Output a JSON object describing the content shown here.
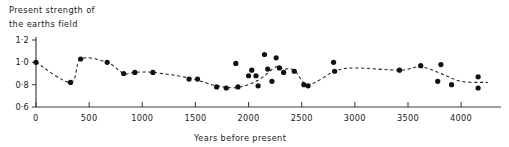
{
  "figure": {
    "title_line1": "Present strength of",
    "title_line2": "the earths field",
    "background_color": "#ffffff",
    "ink_color": "#1a1a1a"
  },
  "chart_data": {
    "type": "scatter",
    "title": "Present strength of the earths field",
    "xlabel": "Years before present",
    "ylabel": "Present strength of the earths field",
    "xlim": [
      0,
      4300
    ],
    "ylim": [
      0.6,
      1.2
    ],
    "grid": false,
    "legend": null,
    "x_ticks": [
      0,
      500,
      1000,
      1500,
      2000,
      2500,
      3000,
      3500,
      4000
    ],
    "x_tick_labels": [
      "0",
      "500",
      "1000",
      "1500",
      "2000",
      "2500",
      "3000",
      "3500",
      "4000"
    ],
    "y_ticks": [
      0.6,
      0.8,
      1.0,
      1.2
    ],
    "y_tick_labels": [
      "0·6",
      "0·8",
      "1·0",
      "1·2"
    ],
    "origin_label": "0",
    "marker": "filled-circle",
    "marker_color": "#121212",
    "trend_line_style": "dashed",
    "trend_line_color": "#222222",
    "points": [
      {
        "x": 0,
        "y": 1.0
      },
      {
        "x": 325,
        "y": 0.82
      },
      {
        "x": 420,
        "y": 1.03
      },
      {
        "x": 670,
        "y": 1.0
      },
      {
        "x": 825,
        "y": 0.9
      },
      {
        "x": 930,
        "y": 0.91
      },
      {
        "x": 1100,
        "y": 0.91
      },
      {
        "x": 1440,
        "y": 0.85
      },
      {
        "x": 1520,
        "y": 0.85
      },
      {
        "x": 1700,
        "y": 0.78
      },
      {
        "x": 1790,
        "y": 0.77
      },
      {
        "x": 1880,
        "y": 0.99
      },
      {
        "x": 1900,
        "y": 0.78
      },
      {
        "x": 2000,
        "y": 0.88
      },
      {
        "x": 2030,
        "y": 0.93
      },
      {
        "x": 2070,
        "y": 0.88
      },
      {
        "x": 2090,
        "y": 0.79
      },
      {
        "x": 2150,
        "y": 1.07
      },
      {
        "x": 2180,
        "y": 0.94
      },
      {
        "x": 2220,
        "y": 0.83
      },
      {
        "x": 2260,
        "y": 1.04
      },
      {
        "x": 2290,
        "y": 0.95
      },
      {
        "x": 2330,
        "y": 0.91
      },
      {
        "x": 2430,
        "y": 0.92
      },
      {
        "x": 2520,
        "y": 0.8
      },
      {
        "x": 2560,
        "y": 0.79
      },
      {
        "x": 2800,
        "y": 1.0
      },
      {
        "x": 2810,
        "y": 0.92
      },
      {
        "x": 3420,
        "y": 0.93
      },
      {
        "x": 3620,
        "y": 0.97
      },
      {
        "x": 3810,
        "y": 0.98
      },
      {
        "x": 3780,
        "y": 0.83
      },
      {
        "x": 3910,
        "y": 0.8
      },
      {
        "x": 4160,
        "y": 0.87
      },
      {
        "x": 4160,
        "y": 0.77
      }
    ],
    "trend_points": [
      {
        "x": 0,
        "y": 1.0
      },
      {
        "x": 325,
        "y": 0.82
      },
      {
        "x": 420,
        "y": 1.03
      },
      {
        "x": 670,
        "y": 1.0
      },
      {
        "x": 825,
        "y": 0.9
      },
      {
        "x": 930,
        "y": 0.91
      },
      {
        "x": 1100,
        "y": 0.91
      },
      {
        "x": 1440,
        "y": 0.86
      },
      {
        "x": 1700,
        "y": 0.79
      },
      {
        "x": 1900,
        "y": 0.775
      },
      {
        "x": 2090,
        "y": 0.84
      },
      {
        "x": 2260,
        "y": 0.96
      },
      {
        "x": 2330,
        "y": 0.94
      },
      {
        "x": 2430,
        "y": 0.93
      },
      {
        "x": 2560,
        "y": 0.8
      },
      {
        "x": 2810,
        "y": 0.92
      },
      {
        "x": 3000,
        "y": 0.95
      },
      {
        "x": 3420,
        "y": 0.93
      },
      {
        "x": 3620,
        "y": 0.96
      },
      {
        "x": 3810,
        "y": 0.9
      },
      {
        "x": 4000,
        "y": 0.83
      },
      {
        "x": 4250,
        "y": 0.82
      }
    ]
  }
}
